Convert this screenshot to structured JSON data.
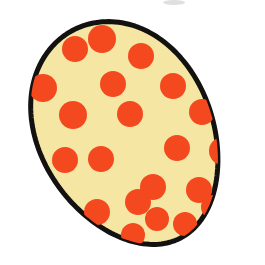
{
  "canvas": {
    "width": 265,
    "height": 265,
    "background_color": "#ffffff",
    "title": "Spotted egg illustration"
  },
  "figure": {
    "name": "spotted-egg",
    "shape": "egg-oval",
    "fill_color": "#f6e6a4",
    "outline_color": "#141210",
    "outline_width": 5,
    "center_x": 127,
    "center_y": 134,
    "radius_x": 93,
    "radius_y": 117,
    "rotation_deg": -27,
    "egg_taper": 0.86
  },
  "spots": {
    "name": "red-spots",
    "color": "#f4481f",
    "count": 21,
    "items": [
      {
        "id": "spot-1",
        "cx": 75,
        "cy": 49,
        "r": 13
      },
      {
        "id": "spot-2",
        "cx": 102,
        "cy": 39,
        "r": 14
      },
      {
        "id": "spot-3",
        "cx": 141,
        "cy": 56,
        "r": 13
      },
      {
        "id": "spot-4",
        "cx": 43,
        "cy": 88,
        "r": 14
      },
      {
        "id": "spot-5",
        "cx": 113,
        "cy": 84,
        "r": 13
      },
      {
        "id": "spot-6",
        "cx": 173,
        "cy": 86,
        "r": 13
      },
      {
        "id": "spot-7",
        "cx": 73,
        "cy": 115,
        "r": 14
      },
      {
        "id": "spot-8",
        "cx": 130,
        "cy": 114,
        "r": 13
      },
      {
        "id": "spot-9",
        "cx": 202,
        "cy": 112,
        "r": 13
      },
      {
        "id": "spot-10",
        "cx": 65,
        "cy": 160,
        "r": 13
      },
      {
        "id": "spot-11",
        "cx": 101,
        "cy": 159,
        "r": 13
      },
      {
        "id": "spot-12",
        "cx": 177,
        "cy": 148,
        "r": 13
      },
      {
        "id": "spot-13",
        "cx": 223,
        "cy": 151,
        "r": 14
      },
      {
        "id": "spot-14",
        "cx": 153,
        "cy": 187,
        "r": 13
      },
      {
        "id": "spot-15",
        "cx": 199,
        "cy": 190,
        "r": 13
      },
      {
        "id": "spot-16",
        "cx": 138,
        "cy": 202,
        "r": 13
      },
      {
        "id": "spot-17",
        "cx": 97,
        "cy": 212,
        "r": 13
      },
      {
        "id": "spot-18",
        "cx": 157,
        "cy": 219,
        "r": 12
      },
      {
        "id": "spot-19",
        "cx": 185,
        "cy": 224,
        "r": 12
      },
      {
        "id": "spot-20",
        "cx": 133,
        "cy": 235,
        "r": 12
      },
      {
        "id": "spot-21",
        "cx": 213,
        "cy": 207,
        "r": 12
      }
    ]
  },
  "artifact": {
    "name": "scan-smudge",
    "color": "#d6d4d2",
    "x": 163,
    "y": 0,
    "width": 22,
    "height": 5
  }
}
